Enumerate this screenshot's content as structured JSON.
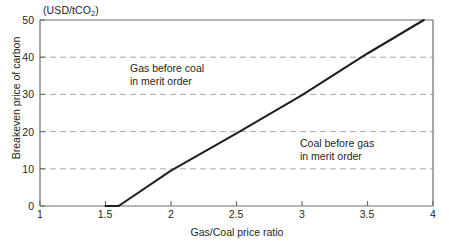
{
  "chart_data": {
    "type": "line",
    "title": "",
    "unit_label": "(USD/tCO2)",
    "unit_label_prefix": "(USD/tCO",
    "unit_label_sub": "2",
    "unit_label_suffix": ")",
    "xlabel": "Gas/Coal price ratio",
    "ylabel": "Breakeven price of carbon",
    "xlim": [
      1,
      4
    ],
    "ylim": [
      0,
      50
    ],
    "xticks": [
      "1",
      "1.5",
      "2",
      "2.5",
      "3",
      "3.5",
      "4"
    ],
    "xtick_values": [
      1,
      1.5,
      2,
      2.5,
      3,
      3.5,
      4
    ],
    "yticks": [
      "0",
      "10",
      "20",
      "30",
      "40",
      "50"
    ],
    "ytick_values": [
      0,
      10,
      20,
      30,
      40,
      50
    ],
    "grid": "horizontal-dashed",
    "gridlines": [
      10,
      20,
      30,
      40
    ],
    "legend": "none",
    "line_color": "#231f20",
    "grid_color": "#a7a9ac",
    "axis_color": "#6d6e71",
    "series": [
      {
        "name": "Breakeven carbon price",
        "x": [
          1.5,
          1.6,
          2.0,
          2.5,
          3.0,
          3.5,
          3.93
        ],
        "values": [
          0,
          0,
          9.5,
          19.5,
          29.8,
          41.0,
          50.0
        ]
      }
    ],
    "annotations": [
      {
        "id": "gas-before-coal",
        "line1": "Gas before coal",
        "line2": "in merit order",
        "x": 1.7,
        "y": 37
      },
      {
        "id": "coal-before-gas",
        "line1": "Coal before gas",
        "line2": "in merit order",
        "x": 3.0,
        "y": 17
      }
    ]
  }
}
